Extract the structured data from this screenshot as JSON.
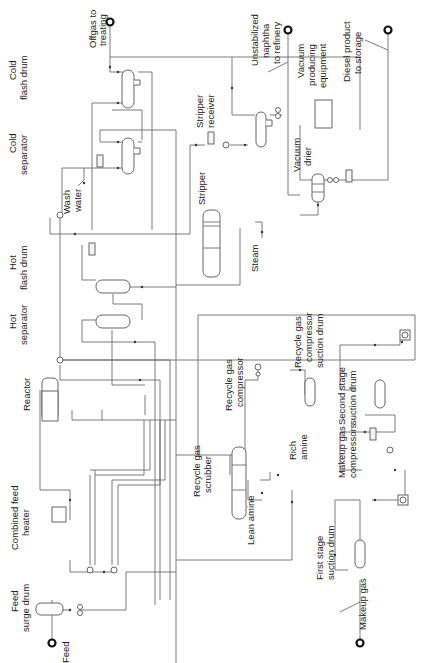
{
  "diagram": {
    "orientation": "rotated 90 degrees counter-clockwise",
    "line_color": "#6b6b6b",
    "text_color": "#222222",
    "labels": {
      "offgas": [
        "Offgas to",
        "treating"
      ],
      "cold_flash_drum": [
        "Cold",
        "flash drum"
      ],
      "cold_separator": [
        "Cold",
        "separator"
      ],
      "wash_water": [
        "Wash",
        "water"
      ],
      "stripper_receiver": [
        "Stripper",
        "receiver"
      ],
      "unstabilized_naphtha": [
        "Unstabilized",
        "naphtha",
        "to refinery"
      ],
      "vacuum_producing": [
        "Vacuum",
        "producing",
        "equipment"
      ],
      "diesel_product": [
        "Diesel product",
        "to storage"
      ],
      "vacuum_drier": [
        "Vacuum",
        "drier"
      ],
      "stripper": [
        "Stripper"
      ],
      "steam": [
        "Steam"
      ],
      "hot_flash_drum": [
        "Hot",
        "flash drum"
      ],
      "hot_separator": [
        "Hot",
        "separator"
      ],
      "recycle_gas_compressor": [
        "Recycle gas",
        "compressor"
      ],
      "recycle_gas_compressor_suction_drum": [
        "Recycle gas",
        "compressor",
        "suction drum"
      ],
      "second_stage_suction_drum": [
        "Second stage",
        "suction drum"
      ],
      "reactor": [
        "Reactor"
      ],
      "recycle_gas_scrubber": [
        "Recycle gas",
        "scrubber"
      ],
      "rich_amine": [
        "Rich",
        "amine"
      ],
      "makeup_gas_compressors": [
        "Makeup gas",
        "compressors"
      ],
      "combined_feed_heater": [
        "Combined feed",
        "heater"
      ],
      "lean_amine": [
        "Lean amine"
      ],
      "first_stage_suction_drum": [
        "First stage",
        "suction drum"
      ],
      "feed_surge_drum": [
        "Feed",
        "surge drum"
      ],
      "feed": [
        "Feed"
      ],
      "makeup_gas": [
        "Makeup gas"
      ]
    }
  }
}
